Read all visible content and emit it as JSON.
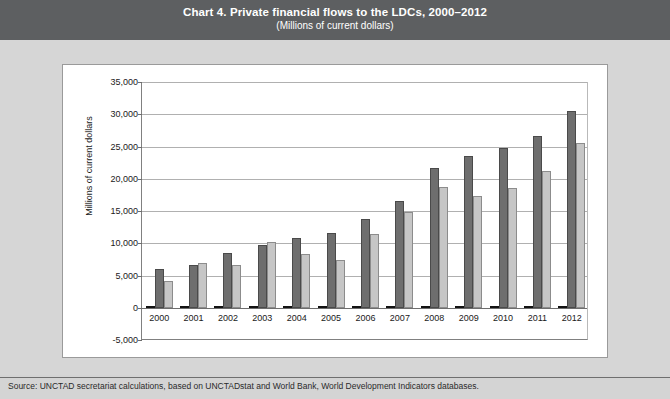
{
  "title": {
    "main": "Chart 4. Private financial flows to the LDCs, 2000–2012",
    "subtitle": "(Millions of current dollars)"
  },
  "source_note": "Source:  UNCTAD secretariat calculations, based on UNCTADstat and World Bank, World Development Indicators databases.",
  "chart_data": {
    "type": "bar",
    "title": "Chart 4. Private financial flows to the LDCs, 2000–2012",
    "subtitle": "(Millions of current dollars)",
    "xlabel": "",
    "ylabel": "Millions of current dollars",
    "ylim": [
      -5000,
      35000
    ],
    "ytick_labels": [
      "35,000",
      "30,000",
      "25,000",
      "20,000",
      "15,000",
      "10,000",
      "5,000",
      "0",
      "-5,000"
    ],
    "ytick_values": [
      35000,
      30000,
      25000,
      20000,
      15000,
      10000,
      5000,
      0,
      -5000
    ],
    "grid": true,
    "legend_position": "bottom",
    "categories": [
      "2000",
      "2001",
      "2002",
      "2003",
      "2004",
      "2005",
      "2006",
      "2007",
      "2008",
      "2009",
      "2010",
      "2011",
      "2012"
    ],
    "series": [
      {
        "name": "Portfolio equity, net inflows",
        "color": "#262626",
        "values": [
          0,
          0,
          0,
          0,
          0,
          0,
          0,
          0,
          0,
          0,
          0,
          0,
          0
        ]
      },
      {
        "name": "Remittances",
        "color": "#6e6e6e",
        "values": [
          6000,
          6700,
          8500,
          9800,
          10800,
          11600,
          13700,
          16500,
          21700,
          23500,
          24700,
          26700,
          30500
        ]
      },
      {
        "name": "Inward FDI",
        "color": "#c6c6c6",
        "values": [
          4100,
          7000,
          6600,
          10200,
          8400,
          7400,
          11400,
          14900,
          18800,
          17400,
          18600,
          21200,
          25500
        ]
      }
    ]
  }
}
